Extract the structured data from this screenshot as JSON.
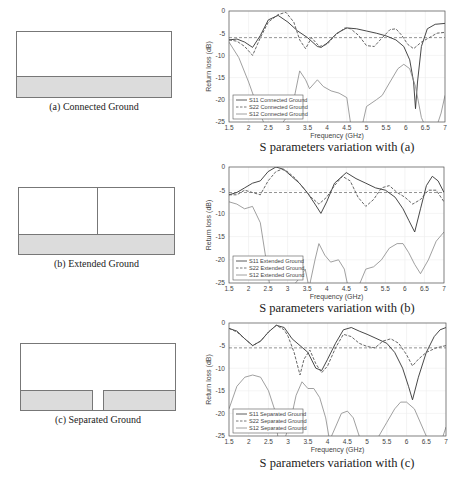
{
  "diagrams": [
    {
      "caption": "(a) Connected Ground",
      "type": "connected"
    },
    {
      "caption": "(b) Extended Ground",
      "type": "extended"
    },
    {
      "caption": "(c) Separated Ground",
      "type": "separated"
    }
  ],
  "chart_captions": [
    "S parameters variation with (a)",
    "S parameters variation with (b)",
    "S parameters variation with (c)"
  ],
  "chart_data": [
    {
      "type": "line",
      "title": "",
      "xlabel": "Frequency (GHz)",
      "ylabel": "Return loss (dB)",
      "xlim": [
        1.5,
        7
      ],
      "ylim": [
        -25,
        0
      ],
      "xticks": [
        "1.5",
        "2",
        "2.5",
        "3",
        "3.5",
        "4",
        "4.5",
        "5",
        "5.5",
        "6",
        "6.5",
        "7"
      ],
      "yticks": [
        "0",
        "-5",
        "-10",
        "-15",
        "-20",
        "-25"
      ],
      "grid": true,
      "legend_position": "bottom-left",
      "reference_line": -6,
      "series": [
        {
          "name": "S11 Connected Ground",
          "style": "solid",
          "x": [
            1.5,
            1.7,
            1.9,
            2.1,
            2.3,
            2.5,
            2.75,
            3.0,
            3.25,
            3.5,
            3.75,
            3.85,
            4.0,
            4.25,
            4.5,
            4.75,
            5.0,
            5.25,
            5.5,
            5.75,
            5.95,
            6.1,
            6.2,
            6.25,
            6.3,
            6.4,
            6.55,
            6.75,
            7.0
          ],
          "y": [
            -6.5,
            -6.3,
            -7.0,
            -8.2,
            -5.5,
            -2.0,
            -1.0,
            -2.5,
            -4.5,
            -6.0,
            -8.0,
            -8.2,
            -7.2,
            -5.0,
            -3.8,
            -4.0,
            -4.5,
            -5.0,
            -5.6,
            -6.5,
            -8.0,
            -11.0,
            -16.0,
            -22.0,
            -16.0,
            -8.0,
            -4.0,
            -3.0,
            -2.8
          ]
        },
        {
          "name": "S22 Connected Ground",
          "style": "dashed",
          "x": [
            1.5,
            1.7,
            1.9,
            2.1,
            2.3,
            2.5,
            2.75,
            2.95,
            3.15,
            3.3,
            3.45,
            3.6,
            3.8,
            4.0,
            4.2,
            4.45,
            4.6,
            4.8,
            5.0,
            5.2,
            5.35,
            5.6,
            5.75,
            5.9,
            6.05,
            6.2,
            6.4,
            6.6,
            6.8,
            7.0
          ],
          "y": [
            -6.5,
            -6.8,
            -8.0,
            -10.0,
            -6.0,
            -2.5,
            -0.8,
            -0.3,
            -2.5,
            -6.5,
            -8.5,
            -6.0,
            -8.0,
            -7.5,
            -5.5,
            -3.8,
            -4.0,
            -5.5,
            -7.8,
            -8.0,
            -6.5,
            -4.2,
            -4.0,
            -5.5,
            -7.5,
            -8.5,
            -7.0,
            -6.0,
            -5.0,
            -4.8
          ]
        },
        {
          "name": "S12 Connected Ground",
          "style": "solid",
          "x": [
            1.5,
            1.75,
            2.0,
            2.2,
            2.4,
            2.6,
            2.8,
            3.0,
            3.15,
            3.3,
            3.45,
            3.55,
            3.75,
            3.9,
            4.1,
            4.3,
            4.5,
            4.6,
            4.75,
            4.9,
            5.0,
            5.25,
            5.4,
            5.6,
            5.8,
            5.95,
            6.1,
            6.25,
            6.4,
            6.55,
            6.75,
            6.9,
            7.0
          ],
          "y": [
            -7.0,
            -10.5,
            -16.0,
            -21.0,
            -25.5,
            -26,
            -26,
            -23.5,
            -20.0,
            -13.5,
            -15.5,
            -17.5,
            -15.5,
            -17.0,
            -18.0,
            -18.5,
            -19.5,
            -25.5,
            -27,
            -25.5,
            -21.5,
            -20.0,
            -19.0,
            -16.0,
            -13.0,
            -12.0,
            -13.0,
            -17.0,
            -24.0,
            -27,
            -27,
            -23.0,
            -19.0
          ]
        }
      ]
    },
    {
      "type": "line",
      "title": "",
      "xlabel": "Frequency (GHz)",
      "ylabel": "Return loss (dB)",
      "xlim": [
        1.5,
        7
      ],
      "ylim": [
        -25,
        0
      ],
      "xticks": [
        "1.5",
        "2",
        "2.5",
        "3",
        "3.5",
        "4",
        "4.5",
        "5",
        "5.5",
        "6",
        "6.5",
        "7"
      ],
      "yticks": [
        "0",
        "-5",
        "-10",
        "-15",
        "-20",
        "-25"
      ],
      "grid": true,
      "legend_position": "bottom-left",
      "reference_line": -5.5,
      "series": [
        {
          "name": "S11 Extended Ground",
          "style": "solid",
          "x": [
            1.5,
            1.7,
            1.9,
            2.1,
            2.3,
            2.5,
            2.7,
            2.9,
            3.1,
            3.3,
            3.5,
            3.7,
            3.85,
            4.0,
            4.2,
            4.5,
            4.75,
            5.0,
            5.25,
            5.5,
            5.75,
            5.95,
            6.1,
            6.25,
            6.4,
            6.55,
            6.7,
            6.85,
            7.0
          ],
          "y": [
            -6.0,
            -5.5,
            -4.5,
            -3.5,
            -3.0,
            -1.0,
            0,
            -0.5,
            -2.0,
            -3.5,
            -5.5,
            -8.0,
            -10.0,
            -7.5,
            -3.5,
            -1.2,
            -2.5,
            -3.5,
            -4.5,
            -5.0,
            -6.5,
            -9.0,
            -11.5,
            -14.0,
            -9.0,
            -4.0,
            -2.0,
            -3.0,
            -5.5
          ]
        },
        {
          "name": "S22 Extended Ground",
          "style": "dashed",
          "x": [
            1.5,
            1.7,
            1.9,
            2.1,
            2.3,
            2.5,
            2.7,
            2.85,
            3.0,
            3.2,
            3.4,
            3.6,
            3.8,
            4.0,
            4.2,
            4.4,
            4.6,
            4.8,
            5.0,
            5.2,
            5.4,
            5.6,
            5.8,
            6.0,
            6.2,
            6.4,
            6.6,
            6.8,
            7.0
          ],
          "y": [
            -6.0,
            -6.0,
            -5.0,
            -5.5,
            -6.0,
            -3.0,
            -1.0,
            -0.5,
            -1.0,
            -2.5,
            -4.5,
            -6.5,
            -8.0,
            -6.5,
            -4.0,
            -2.0,
            -3.0,
            -6.5,
            -8.5,
            -7.0,
            -4.5,
            -4.0,
            -5.5,
            -6.5,
            -8.0,
            -7.0,
            -5.0,
            -5.0,
            -7.5
          ]
        },
        {
          "name": "S12 Extended Ground",
          "style": "solid",
          "x": [
            1.5,
            1.7,
            1.9,
            2.1,
            2.3,
            2.45,
            2.55,
            2.7,
            2.9,
            3.1,
            3.3,
            3.45,
            3.55,
            3.7,
            3.8,
            3.95,
            4.1,
            4.3,
            4.45,
            4.55,
            4.7,
            4.85,
            5.0,
            5.2,
            5.4,
            5.6,
            5.8,
            5.95,
            6.1,
            6.25,
            6.4,
            6.6,
            6.8,
            7.0
          ],
          "y": [
            -7.5,
            -8.0,
            -9.0,
            -8.5,
            -12.0,
            -20.0,
            -26,
            -26,
            -26,
            -26,
            -24.0,
            -22.0,
            -26,
            -20.0,
            -16.5,
            -19.0,
            -20.5,
            -20.0,
            -22.0,
            -26,
            -27,
            -25.0,
            -22.0,
            -21.5,
            -20.0,
            -17.5,
            -16.5,
            -16.5,
            -18.5,
            -21.0,
            -23.0,
            -20.0,
            -16.0,
            -14.0
          ]
        }
      ]
    },
    {
      "type": "line",
      "title": "",
      "xlabel": "Frequency (GHz)",
      "ylabel": "Return loss (dB)",
      "xlim": [
        1.5,
        7
      ],
      "ylim": [
        -25,
        0
      ],
      "xticks": [
        "1.5",
        "2",
        "2.5",
        "3",
        "3.5",
        "4",
        "4.5",
        "5",
        "5.5",
        "6",
        "6.5",
        "7"
      ],
      "yticks": [
        "0",
        "-5",
        "-10",
        "-15",
        "-20",
        "-25"
      ],
      "grid": true,
      "legend_position": "bottom-left",
      "reference_line": -5.5,
      "series": [
        {
          "name": "S11 Separated Ground",
          "style": "solid",
          "x": [
            1.5,
            1.7,
            1.9,
            2.1,
            2.3,
            2.5,
            2.7,
            2.9,
            3.1,
            3.3,
            3.5,
            3.7,
            3.85,
            4.0,
            4.2,
            4.4,
            4.6,
            4.8,
            5.0,
            5.25,
            5.5,
            5.7,
            5.9,
            6.05,
            6.15,
            6.3,
            6.5,
            6.7,
            6.85,
            7.0
          ],
          "y": [
            -1.2,
            -1.8,
            -3.5,
            -5.0,
            -4.0,
            -2.0,
            -0.5,
            -1.0,
            -3.5,
            -5.0,
            -6.5,
            -10.0,
            -10.5,
            -8.0,
            -4.5,
            -1.5,
            -1.0,
            -1.8,
            -2.5,
            -3.5,
            -4.5,
            -6.5,
            -10.0,
            -14.0,
            -17.0,
            -12.0,
            -6.5,
            -3.0,
            -1.5,
            -1.0
          ]
        },
        {
          "name": "S22 Separated Ground",
          "style": "dashed",
          "x": [
            1.5,
            1.7,
            1.9,
            2.1,
            2.3,
            2.5,
            2.7,
            2.9,
            3.0,
            3.15,
            3.3,
            3.4,
            3.55,
            3.7,
            3.85,
            4.0,
            4.2,
            4.4,
            4.6,
            4.8,
            5.0,
            5.2,
            5.4,
            5.6,
            5.8,
            6.0,
            6.15,
            6.3,
            6.5,
            6.75,
            7.0
          ],
          "y": [
            -1.2,
            -2.0,
            -3.5,
            -5.0,
            -4.0,
            -2.0,
            -0.5,
            -1.5,
            -3.0,
            -6.5,
            -11.5,
            -8.0,
            -6.0,
            -9.0,
            -11.0,
            -9.5,
            -5.5,
            -2.5,
            -3.0,
            -4.5,
            -5.2,
            -5.5,
            -4.0,
            -3.5,
            -4.5,
            -7.0,
            -9.5,
            -8.0,
            -6.5,
            -5.5,
            -5.0
          ]
        },
        {
          "name": "S12 Separated Ground",
          "style": "solid",
          "x": [
            1.5,
            1.7,
            1.9,
            2.1,
            2.3,
            2.5,
            2.65,
            2.75,
            2.9,
            3.05,
            3.2,
            3.35,
            3.5,
            3.65,
            3.8,
            3.95,
            4.05,
            4.2,
            4.35,
            4.5,
            4.65,
            4.8,
            4.95,
            5.1,
            5.3,
            5.5,
            5.7,
            5.85,
            6.0,
            6.2,
            6.4,
            6.55,
            6.7,
            6.85,
            7.0
          ],
          "y": [
            -19.0,
            -14.0,
            -12.0,
            -11.5,
            -12.0,
            -15.0,
            -19.0,
            -26,
            -26,
            -22.0,
            -16.0,
            -13.0,
            -14.5,
            -14.5,
            -16.5,
            -21.0,
            -26,
            -23.0,
            -20.0,
            -19.5,
            -21.0,
            -25.0,
            -27,
            -27,
            -25.0,
            -22.0,
            -19.0,
            -17.5,
            -17.5,
            -19.0,
            -23.0,
            -26,
            -27,
            -27,
            -23.0
          ]
        }
      ]
    }
  ]
}
